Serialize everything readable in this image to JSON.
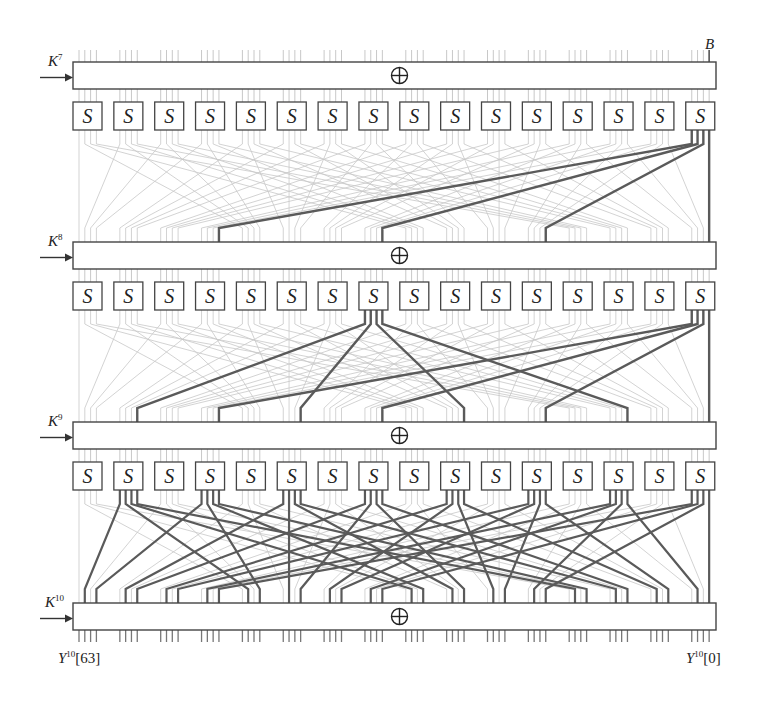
{
  "diagram": {
    "title_label": "B",
    "key_labels": [
      {
        "base": "K",
        "sup": "7"
      },
      {
        "base": "K",
        "sup": "8"
      },
      {
        "base": "K",
        "sup": "9"
      },
      {
        "base": "K",
        "sup": "10"
      }
    ],
    "output_labels": {
      "left": {
        "base": "Y",
        "sup": "10",
        "index": "[63]"
      },
      "right": {
        "base": "Y",
        "sup": "10",
        "index": "[0]"
      }
    },
    "xor_symbol": "⊕",
    "sbox_label": "S",
    "sbox_count_per_row": 16,
    "sbox_rows": 3,
    "xor_layers": 4,
    "permutation": "PRESENT bit permutation P(i)=16·i mod 63, P(63)=63",
    "active_trail": {
      "start_sbox_index_from_right": 0,
      "round_1_active_bits_from_right": [
        0
      ],
      "round_2_active_sboxes_from_right": [
        0,
        8
      ],
      "round_3_active_sboxes_from_right": [
        0,
        2,
        4,
        6,
        8,
        10,
        12,
        14
      ]
    },
    "colors": {
      "box_stroke": "#444444",
      "wire_faint": "#c8c8c8",
      "wire_active": "#5a5a5a",
      "text": "#222222"
    }
  }
}
